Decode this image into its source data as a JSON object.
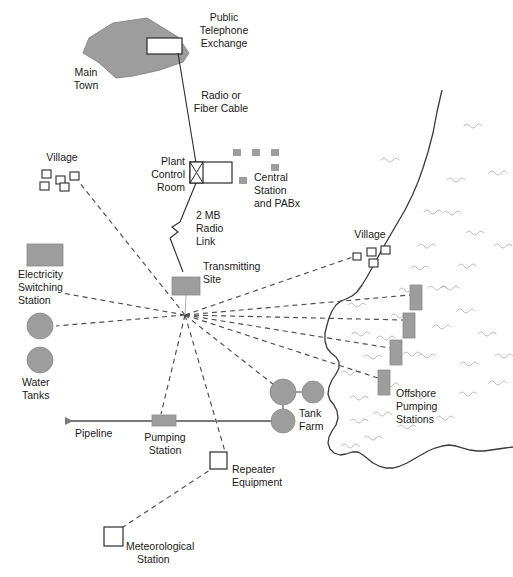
{
  "diagram": {
    "colors": {
      "fill_gray": "#9d9d9d",
      "line_dark": "#2b2b2b",
      "dash_gray": "#4d4d4d",
      "wave_gray": "#b5b5b5",
      "pipeline_gray": "#7a7a7a",
      "background": "#ffffff"
    },
    "labels": {
      "public_telephone_exchange": [
        "Public",
        "Telephone",
        "Exchange"
      ],
      "main_town": [
        "Main",
        "Town"
      ],
      "radio_or_fiber_cable": [
        "Radio or",
        "Fiber Cable"
      ],
      "plant_control_room": [
        "Plant",
        "Control",
        "Room"
      ],
      "central_station_and_pabx": [
        "Central",
        "Station",
        "and PABx"
      ],
      "village_left": "Village",
      "village_right": "Village",
      "two_mb_radio_link": [
        "2 MB",
        "Radio",
        "Link"
      ],
      "transmitting_site": [
        "Transmitting",
        "Site"
      ],
      "electricity_switching_station": [
        "Electricity",
        "Switching",
        "Station"
      ],
      "water_tanks": [
        "Water",
        "Tanks"
      ],
      "pipeline": "Pipeline",
      "pumping_station": [
        "Pumping",
        "Station"
      ],
      "tank_farm": [
        "Tank",
        "Farm"
      ],
      "repeater_equipment": [
        "Repeater",
        "Equipment"
      ],
      "meteorological_station": [
        "Meteorological",
        "Station"
      ],
      "offshore_pumping_stations": [
        "Offshore",
        "Pumping",
        "Stations"
      ]
    },
    "nodes": {
      "main_town": {
        "kind": "filled-polygon",
        "label": "Main Town"
      },
      "public_telephone_exchange": {
        "kind": "open-rect",
        "label": "Public Telephone Exchange"
      },
      "plant_control_room": {
        "kind": "rect-with-x",
        "label": "Plant Control Room"
      },
      "central_station_and_pabx": {
        "kind": "small-square-cluster",
        "count": 6,
        "label": "Central Station and PABx"
      },
      "village_left": {
        "kind": "open-square-cluster",
        "count": 5,
        "label": "Village"
      },
      "village_right": {
        "kind": "open-square-cluster",
        "count": 4,
        "label": "Village"
      },
      "transmitting_site": {
        "kind": "filled-rect",
        "label": "Transmitting Site"
      },
      "electricity_switching_station": {
        "kind": "filled-rect",
        "label": "Electricity Switching Station"
      },
      "water_tanks": {
        "kind": "filled-circles",
        "count": 2,
        "label": "Water Tanks"
      },
      "pumping_station": {
        "kind": "filled-rect",
        "label": "Pumping Station"
      },
      "tank_farm": {
        "kind": "filled-circles",
        "count": 3,
        "label": "Tank Farm"
      },
      "repeater_equipment": {
        "kind": "open-square",
        "label": "Repeater Equipment"
      },
      "meteorological_station": {
        "kind": "open-square",
        "label": "Meteorological Station"
      },
      "offshore_pumping_stations": {
        "kind": "filled-rects",
        "count": 4,
        "label": "Offshore Pumping Stations"
      }
    },
    "links": [
      {
        "from": "public_telephone_exchange",
        "to": "plant_control_room",
        "style": "solid",
        "label": "Radio or Fiber Cable"
      },
      {
        "from": "plant_control_room",
        "to": "transmitting_site",
        "style": "solid-with-break",
        "label": "2 MB Radio Link"
      },
      {
        "from": "transmitting_site",
        "to": "village_left",
        "style": "dashed"
      },
      {
        "from": "transmitting_site",
        "to": "electricity_switching_station",
        "style": "dashed"
      },
      {
        "from": "transmitting_site",
        "to": "water_tanks",
        "style": "dashed"
      },
      {
        "from": "transmitting_site",
        "to": "village_right",
        "style": "dashed"
      },
      {
        "from": "transmitting_site",
        "to": "offshore_pumping_station_1",
        "style": "dashed"
      },
      {
        "from": "transmitting_site",
        "to": "offshore_pumping_station_2",
        "style": "dashed"
      },
      {
        "from": "transmitting_site",
        "to": "offshore_pumping_station_3",
        "style": "dashed"
      },
      {
        "from": "transmitting_site",
        "to": "offshore_pumping_station_4",
        "style": "dashed"
      },
      {
        "from": "transmitting_site",
        "to": "pumping_station",
        "style": "dashed"
      },
      {
        "from": "transmitting_site",
        "to": "tank_farm",
        "style": "dashed"
      },
      {
        "from": "transmitting_site",
        "to": "repeater_equipment",
        "style": "dashed"
      },
      {
        "from": "repeater_equipment",
        "to": "meteorological_station",
        "style": "dashed"
      },
      {
        "from": "tank_farm",
        "to": "pipeline_arrow",
        "style": "solid",
        "label": "Pipeline"
      }
    ]
  }
}
